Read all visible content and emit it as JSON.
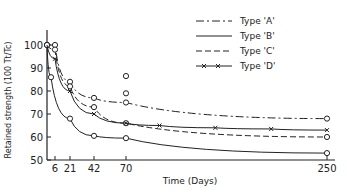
{
  "chart_data": {
    "type": "line",
    "title": "",
    "xlabel": "Time (Days)",
    "ylabel": "Retained strength (100 Tt/Tc)",
    "xlim": [
      0,
      250
    ],
    "ylim": [
      50,
      100
    ],
    "x_ticks": [
      6,
      21,
      42,
      70,
      250
    ],
    "y_ticks": [
      50,
      60,
      70,
      80,
      90,
      100
    ],
    "grid": false,
    "legend_position": "upper right",
    "series": [
      {
        "name": "Type 'A'",
        "style": "dash-dot",
        "marker": "circle",
        "x": [
          0,
          6,
          21,
          42,
          70,
          250
        ],
        "y": [
          100,
          100,
          84,
          77,
          75,
          68
        ]
      },
      {
        "name": "Type 'B'",
        "style": "solid",
        "marker": "circle",
        "x": [
          0,
          3,
          21,
          42,
          70,
          250
        ],
        "y": [
          100,
          86,
          68,
          60.5,
          59.5,
          53
        ]
      },
      {
        "name": "Type 'C'",
        "style": "dashed",
        "marker": "circle",
        "x": [
          0,
          6,
          21,
          42,
          70,
          250
        ],
        "y": [
          100,
          98,
          82,
          73,
          66,
          60
        ]
      },
      {
        "name": "Type 'D'",
        "style": "cross-line",
        "marker": "x",
        "x": [
          0,
          6,
          21,
          42,
          70,
          100,
          150,
          200,
          250
        ],
        "y": [
          100,
          94,
          80,
          70,
          66,
          65,
          64,
          63.5,
          63
        ]
      }
    ],
    "extra_points": [
      {
        "x": 70,
        "y": 86.5
      },
      {
        "x": 70,
        "y": 79
      }
    ]
  },
  "labels": {
    "xlabel": "Time (Days)",
    "ylabel": "Retained strength (100 T",
    "legend": [
      "Type 'A'",
      "Type 'B'",
      "Type 'C'",
      "Type 'D'"
    ]
  }
}
